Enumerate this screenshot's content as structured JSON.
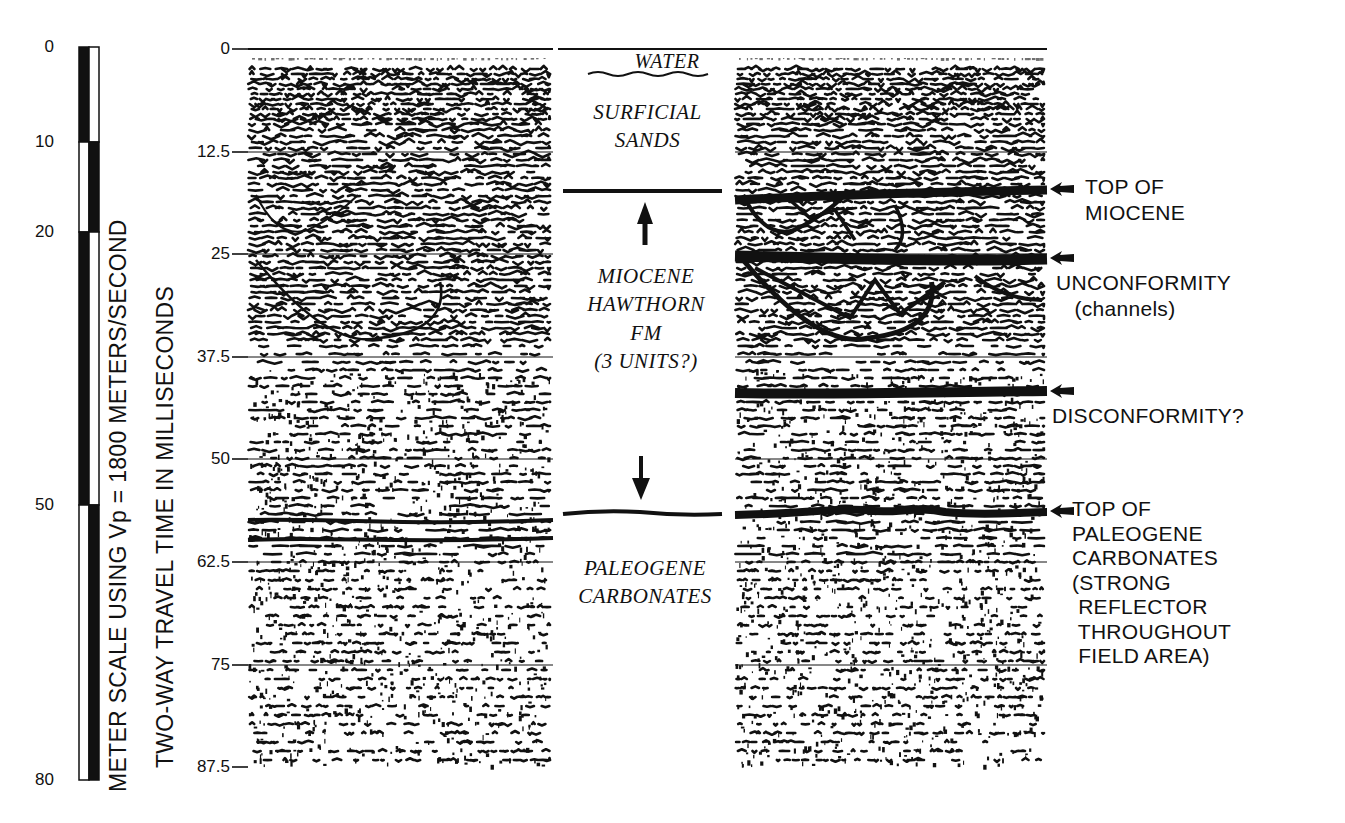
{
  "figure": {
    "colors": {
      "ink": "#111111",
      "paper": "#ffffff"
    }
  },
  "meter_scale": {
    "label": "METER SCALE USING Vp = 1800 METERS/SECOND",
    "ticks": [
      {
        "value": "0",
        "y": 47
      },
      {
        "value": "10",
        "y": 142
      },
      {
        "value": "20",
        "y": 232
      },
      {
        "value": "50",
        "y": 505
      },
      {
        "value": "80",
        "y": 780
      }
    ]
  },
  "time_axis": {
    "label": "TWO-WAY TRAVEL TIME IN MILLISECONDS",
    "ticks": [
      {
        "value": "0",
        "y": 49
      },
      {
        "value": "12.5",
        "y": 152
      },
      {
        "value": "25",
        "y": 254
      },
      {
        "value": "37.5",
        "y": 357
      },
      {
        "value": "50",
        "y": 459
      },
      {
        "value": "62.5",
        "y": 562
      },
      {
        "value": "75",
        "y": 665
      },
      {
        "value": "87.5",
        "y": 767
      }
    ]
  },
  "panels": {
    "raw_section": {
      "name": "Uninterpreted seismic section",
      "x0": 248,
      "x1": 553
    },
    "interpreted_section": {
      "name": "Interpreted seismic section",
      "x0": 735,
      "x1": 1047
    }
  },
  "column": {
    "water": "WATER",
    "surficial": [
      "SURFICIAL",
      "SANDS"
    ],
    "miocene": [
      "MIOCENE",
      "HAWTHORN",
      "FM",
      "(3 UNITS?)"
    ],
    "paleogene": [
      "PALEOGENE",
      "CARBONATES"
    ]
  },
  "annotations": [
    {
      "id": "top-of-miocene",
      "text": "TOP OF\nMIOCENE",
      "y": 175,
      "arrow_y": 189
    },
    {
      "id": "unconformity",
      "text": "UNCONFORMITY\n   (channels)",
      "y": 270,
      "arrow_y": 258
    },
    {
      "id": "disconformity",
      "text": "DISCONFORMITY?",
      "y": 403,
      "arrow_y": 391
    },
    {
      "id": "top-of-paleogene",
      "text": "TOP OF\nPALEOGENE\nCARBONATES\n(STRONG\n REFLECTOR\n THROUGHOUT\n FIELD AREA)",
      "y": 498,
      "arrow_y": 511
    }
  ]
}
